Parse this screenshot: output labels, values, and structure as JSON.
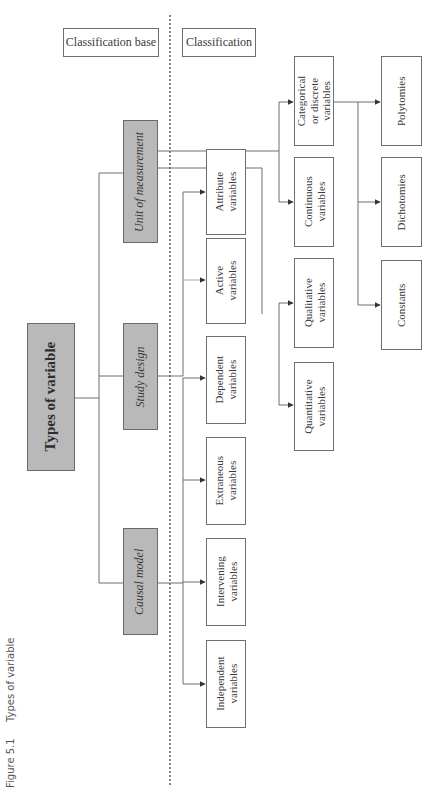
{
  "figure": {
    "number": "Figure 5.1",
    "title": "Types of variable"
  },
  "headers": {
    "base": "Classification base",
    "classification": "Classification"
  },
  "root": {
    "label": "Types of variable"
  },
  "bases": {
    "unit": "Unit of measurement",
    "study": "Study design",
    "causal": "Causal model"
  },
  "nodes": {
    "attribute": [
      "Attribute",
      "variables"
    ],
    "active": [
      "Active",
      "variables"
    ],
    "dependent": [
      "Dependent",
      "variables"
    ],
    "extraneous": [
      "Extraneous",
      "variables"
    ],
    "intervening": [
      "Intervening",
      "variables"
    ],
    "independent": [
      "Independent",
      "variables"
    ],
    "categorical": [
      "Categorical",
      "or discrete",
      "variables"
    ],
    "continuous": [
      "Continuous",
      "variables"
    ],
    "qualitative": [
      "Qualitative",
      "variables"
    ],
    "quantitative": [
      "Quantitative",
      "variables"
    ],
    "polytomies": [
      "Polytomies"
    ],
    "dichotomies": [
      "Dichotomies"
    ],
    "constants": [
      "Constants"
    ]
  },
  "colors": {
    "base_fill": "#b9b9b9",
    "line": "#6e6e6e",
    "text": "#3a3a3a"
  }
}
